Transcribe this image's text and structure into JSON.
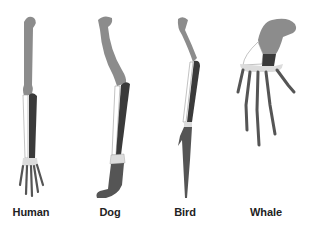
{
  "figure": {
    "colors": {
      "humerus": "#8c8c8c",
      "radius": "#ffffff",
      "ulna": "#3a3a3a",
      "carpals": "#dcdcdc",
      "phalanges": "#555555",
      "outline": "#9a9a9a"
    },
    "limbs": [
      {
        "id": "human",
        "label": "Human"
      },
      {
        "id": "dog",
        "label": "Dog"
      },
      {
        "id": "bird",
        "label": "Bird"
      },
      {
        "id": "whale",
        "label": "Whale"
      }
    ]
  }
}
